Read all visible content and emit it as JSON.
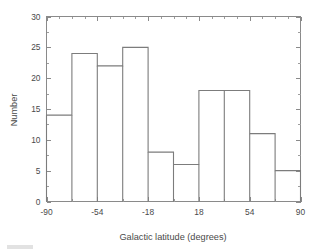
{
  "chart_data": {
    "type": "bar",
    "title": "",
    "subtitle": "",
    "xlabel": "Galactic latitude  (degrees)",
    "ylabel": "Number",
    "xlim": [
      -90,
      90
    ],
    "ylim": [
      0,
      30
    ],
    "bin_width": 18,
    "bin_edges": [
      -90,
      -72,
      -54,
      -36,
      -18,
      0,
      18,
      36,
      54,
      72,
      90
    ],
    "categories": [
      "-90 to -72",
      "-72 to -54",
      "-54 to -36",
      "-36 to -18",
      "-18 to 0",
      "0 to 18",
      "18 to 36",
      "36 to 54",
      "54 to 72",
      "72 to 90"
    ],
    "values": [
      14,
      24,
      22,
      25,
      8,
      6,
      18,
      18,
      11,
      5
    ],
    "xticks": [
      -90,
      -54,
      -18,
      18,
      54,
      90
    ],
    "xtick_labels": [
      "-90",
      "-54",
      "-18",
      "18",
      "54",
      "90"
    ],
    "xtick_minor_step": 18,
    "yticks": [
      0,
      5,
      10,
      15,
      20,
      25,
      30
    ],
    "ytick_labels": [
      "0",
      "5",
      "10",
      "15",
      "20",
      "25",
      "30"
    ],
    "ytick_minor_step": 2.5,
    "grid": false,
    "legend": null,
    "legend_position": "none",
    "frame": "full-box",
    "tick_direction": "in",
    "annotations": [],
    "colors": {
      "outline": "#7c7c7c",
      "axis": "#8a8a8a",
      "text": "#4a4a4a",
      "background": "#ffffff",
      "fill": "none"
    }
  }
}
